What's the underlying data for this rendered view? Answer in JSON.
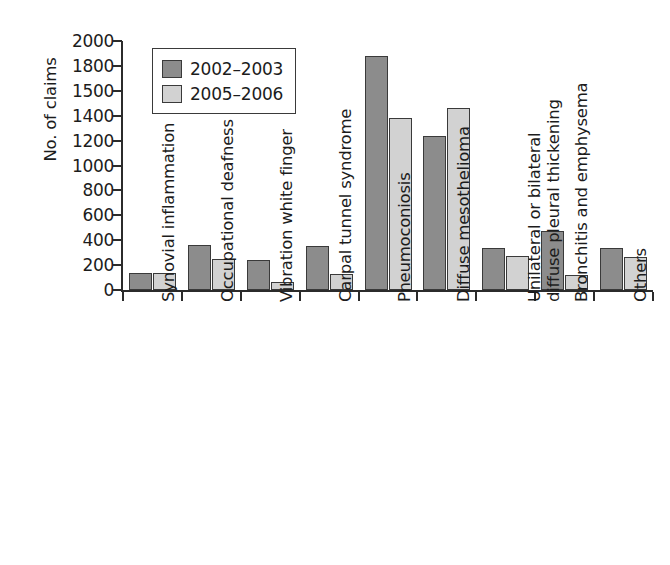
{
  "chart_data": {
    "type": "bar",
    "title": "",
    "xlabel": "",
    "ylabel": "No. of claims",
    "ylim": [
      0,
      2000
    ],
    "grid": false,
    "legend_position": "top-left inside plot",
    "ytick_labels": [
      "2000",
      "1800",
      "1500",
      "1400",
      "1200",
      "1000",
      "800",
      "600",
      "400",
      "200",
      "0"
    ],
    "ytick_values": [
      2000,
      1800,
      1600,
      1400,
      1200,
      1000,
      800,
      600,
      400,
      200,
      0
    ],
    "categories": [
      "Synovial inflammation",
      "Occupational deafness",
      "Vibration white finger",
      "Carpal tunnel syndrome",
      "Pneumoconiosis",
      "Diffuse mesothelioma",
      "Unilateral or bilateral diffuse pleural thickening",
      "Bronchitis and emphysema",
      "Others"
    ],
    "category_label_lines": [
      [
        "Synovial inflammation"
      ],
      [
        "Occupational deafness"
      ],
      [
        "Vibration white finger"
      ],
      [
        "Carpal tunnel syndrome"
      ],
      [
        "Pneumoconiosis"
      ],
      [
        "Diffuse mesothelioma"
      ],
      [
        "Unilateral or bilateral",
        "diffuse pleural thickening"
      ],
      [
        "Bronchitis and emphysema"
      ],
      [
        "Others"
      ]
    ],
    "series": [
      {
        "name": "2002–2003",
        "color": "#8c8c8c",
        "values": [
          140,
          360,
          240,
          350,
          1880,
          1235,
          340,
          470,
          340
        ]
      },
      {
        "name": "2005–2006",
        "color": "#d2d2d2",
        "values": [
          135,
          245,
          65,
          130,
          1385,
          1465,
          275,
          120,
          265
        ]
      }
    ]
  },
  "legend": {
    "entries": [
      {
        "label": "2002–2003",
        "swatch": "series-a"
      },
      {
        "label": "2005–2006",
        "swatch": "series-b"
      }
    ]
  },
  "colors": {
    "series_a": "#8c8c8c",
    "series_b": "#d2d2d2",
    "axis": "#2b2b2b",
    "text": "#1c1c1c",
    "background": "#ffffff"
  }
}
